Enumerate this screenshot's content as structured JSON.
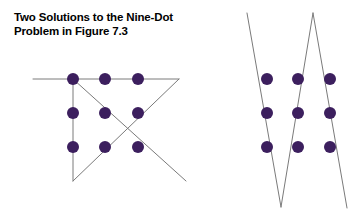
{
  "figure": {
    "title": "Two Solutions to the Nine-Dot\nProblem in Figure 7.3",
    "title_line_1": "Two Solutions to the Nine-Dot",
    "title_line_2": "Problem in Figure 7.3",
    "figure_reference": "Figure 7.3",
    "background_color": "#ffffff"
  },
  "style": {
    "dot_color": "#3c1f5e",
    "line_color": "#7a7a7a",
    "line_width": 1,
    "dot_radius": 6,
    "text_color": "#000000"
  },
  "chart_data": {
    "type": "diagram",
    "title": "Two Solutions to the Nine-Dot Problem in Figure 7.3",
    "xlabel": "",
    "ylabel": "",
    "grid": false,
    "legend": "none",
    "solutions": [
      {
        "name": "solution-left",
        "label": "Left solution: four connected straight lines",
        "dot_grid": {
          "columns_x": [
            73,
            105,
            138
          ],
          "rows_y": [
            79,
            113,
            147
          ],
          "dots": [
            {
              "id": "L-r1c1",
              "x": 73,
              "y": 79
            },
            {
              "id": "L-r1c2",
              "x": 105,
              "y": 79
            },
            {
              "id": "L-r1c3",
              "x": 138,
              "y": 79
            },
            {
              "id": "L-r2c1",
              "x": 73,
              "y": 113
            },
            {
              "id": "L-r2c2",
              "x": 105,
              "y": 113
            },
            {
              "id": "L-r2c3",
              "x": 138,
              "y": 113
            },
            {
              "id": "L-r3c1",
              "x": 73,
              "y": 147
            },
            {
              "id": "L-r3c2",
              "x": 105,
              "y": 147
            },
            {
              "id": "L-r3c3",
              "x": 138,
              "y": 147
            }
          ]
        },
        "lines": [
          {
            "id": "L-line-horizontal-top",
            "x1": 33,
            "y1": 79,
            "x2": 179,
            "y2": 79
          },
          {
            "id": "L-line-vertical-left",
            "x1": 73,
            "y1": 79,
            "x2": 73,
            "y2": 181
          },
          {
            "id": "L-line-diagonal-down-right",
            "x1": 73,
            "y1": 79,
            "x2": 186,
            "y2": 181
          },
          {
            "id": "L-line-diagonal-down-left",
            "x1": 179,
            "y1": 79,
            "x2": 73,
            "y2": 181
          }
        ]
      },
      {
        "name": "solution-right",
        "label": "Right solution: zigzag of near-vertical lines",
        "dot_grid": {
          "columns_x": [
            267,
            298,
            330
          ],
          "rows_y": [
            79,
            113,
            147
          ],
          "dots": [
            {
              "id": "R-r1c1",
              "x": 267,
              "y": 79
            },
            {
              "id": "R-r1c2",
              "x": 298,
              "y": 79
            },
            {
              "id": "R-r1c3",
              "x": 330,
              "y": 79
            },
            {
              "id": "R-r2c1",
              "x": 267,
              "y": 113
            },
            {
              "id": "R-r2c2",
              "x": 298,
              "y": 113
            },
            {
              "id": "R-r2c3",
              "x": 330,
              "y": 113
            },
            {
              "id": "R-r3c1",
              "x": 267,
              "y": 147
            },
            {
              "id": "R-r3c2",
              "x": 298,
              "y": 147
            },
            {
              "id": "R-r3c3",
              "x": 330,
              "y": 147
            }
          ]
        },
        "lines": [
          {
            "id": "R-line-1-down-right",
            "x1": 247,
            "y1": 13,
            "x2": 281,
            "y2": 207
          },
          {
            "id": "R-line-2-up-right",
            "x1": 281,
            "y1": 207,
            "x2": 313,
            "y2": 13
          },
          {
            "id": "R-line-3-down-right",
            "x1": 313,
            "y1": 13,
            "x2": 347,
            "y2": 208
          }
        ]
      }
    ]
  }
}
